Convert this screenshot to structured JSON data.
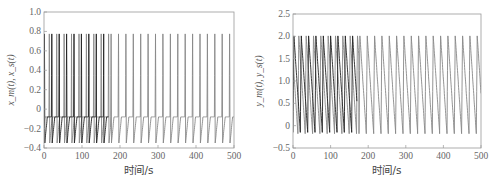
{
  "chart_data": [
    {
      "type": "line",
      "title": "",
      "xlabel": "时间/s",
      "ylabel": "x_m(t), x_s(t)",
      "xlim": [
        0,
        500
      ],
      "ylim": [
        -0.4,
        1.0
      ],
      "xticks": [
        0,
        100,
        200,
        300,
        400,
        500
      ],
      "xtick_labels": [
        "0",
        "100",
        "200",
        "300",
        "400",
        "500"
      ],
      "yticks": [
        -0.4,
        -0.2,
        0,
        0.2,
        0.4,
        0.6,
        0.8,
        1.0
      ],
      "ytick_labels": [
        "-0.4",
        "-0.2",
        "0",
        "0.2",
        "0.4",
        "0.6",
        "0.8",
        "1.0"
      ],
      "grid": false,
      "legend": null,
      "series": [
        {
          "name": "x_m(t)",
          "color": "#222222",
          "period": 19.5,
          "peak": 0.92,
          "trough": -0.35,
          "plateau": -0.08,
          "x_range": [
            0,
            170
          ]
        },
        {
          "name": "x_s(t)",
          "color": "#888888",
          "period": 19.5,
          "peak": 0.92,
          "trough": -0.35,
          "plateau": -0.08,
          "x_range": [
            0,
            500
          ]
        }
      ],
      "notes": "Spiking periodic oscillations; master and slave desynchronized before ~170 s then synchronized (single gray trace) afterwards."
    },
    {
      "type": "line",
      "title": "",
      "xlabel": "时间/s",
      "ylabel": "y_m(t), y_s(t)",
      "xlim": [
        0,
        500
      ],
      "ylim": [
        -0.5,
        2.5
      ],
      "xticks": [
        0,
        100,
        200,
        300,
        400,
        500
      ],
      "xtick_labels": [
        "0",
        "100",
        "200",
        "300",
        "400",
        "500"
      ],
      "yticks": [
        -0.5,
        0,
        0.5,
        1.0,
        1.5,
        2.0,
        2.5
      ],
      "ytick_labels": [
        "-0.5",
        "0",
        "0.5",
        "1.0",
        "1.5",
        "2.0",
        "2.5"
      ],
      "grid": false,
      "legend": null,
      "series": [
        {
          "name": "y_m(t)",
          "color": "#222222",
          "period": 19.5,
          "peak": 2.03,
          "trough": -0.15,
          "x_range": [
            0,
            170
          ]
        },
        {
          "name": "y_s(t)",
          "color": "#888888",
          "period": 19.5,
          "peak": 2.03,
          "trough": -0.18,
          "x_range": [
            0,
            500
          ]
        }
      ],
      "notes": "Sawtooth-like oscillations; synchronized after ~170 s."
    }
  ]
}
